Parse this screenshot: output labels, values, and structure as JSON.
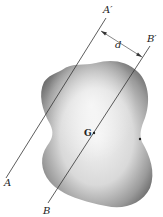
{
  "diagram": {
    "labels": {
      "axis_a_top": "A′",
      "axis_a_bottom": "A",
      "axis_b_top": "B′",
      "axis_b_bottom": "B",
      "distance": "d",
      "center_of_mass": "G"
    },
    "colors": {
      "line": "#333333",
      "body_light": "#f2f2f2",
      "body_dark": "#6e6e6e",
      "background": "#ffffff"
    }
  }
}
